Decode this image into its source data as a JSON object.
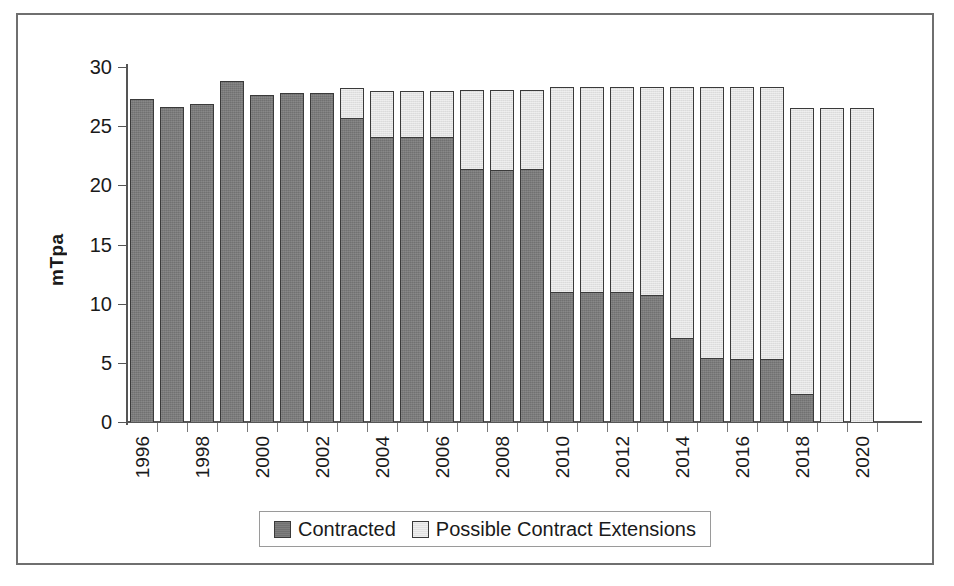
{
  "chart_data": {
    "type": "bar",
    "subtype": "stacked-vertical",
    "title": "",
    "xlabel": "",
    "ylabel": "mTpa",
    "ylim": [
      0,
      30
    ],
    "yticks": [
      0,
      5,
      10,
      15,
      20,
      25,
      30
    ],
    "ytick_labels": [
      "0",
      "5",
      "10",
      "15",
      "20",
      "25",
      "30"
    ],
    "grid": false,
    "legend_position": "bottom-center",
    "categories": [
      "1996",
      "1997",
      "1998",
      "1999",
      "2000",
      "2001",
      "2002",
      "2003",
      "2004",
      "2005",
      "2006",
      "2007",
      "2008",
      "2009",
      "2010",
      "2011",
      "2012",
      "2013",
      "2014",
      "2015",
      "2016",
      "2017",
      "2018",
      "2019",
      "2020"
    ],
    "xtick_labels_shown": [
      "1996",
      "1998",
      "2000",
      "2002",
      "2004",
      "2006",
      "2008",
      "2010",
      "2012",
      "2014",
      "2016",
      "2018",
      "2020"
    ],
    "series": [
      {
        "name": "Contracted",
        "color": "#717171",
        "values": [
          27.3,
          26.6,
          26.9,
          28.8,
          27.6,
          27.8,
          27.8,
          25.7,
          24.1,
          24.1,
          24.1,
          21.4,
          21.3,
          21.4,
          11.0,
          11.0,
          11.0,
          10.7,
          7.1,
          5.4,
          5.3,
          5.3,
          2.4,
          0.0,
          0.0
        ]
      },
      {
        "name": "Possible Contract Extensions",
        "color": "#e2e2e2",
        "values": [
          0.0,
          0.0,
          0.0,
          0.0,
          0.0,
          0.0,
          0.0,
          2.5,
          3.9,
          3.9,
          3.9,
          6.7,
          6.8,
          6.7,
          17.3,
          17.3,
          17.3,
          17.6,
          21.2,
          22.9,
          23.0,
          23.0,
          24.1,
          26.5,
          26.5
        ]
      }
    ],
    "totals": [
      27.3,
      26.6,
      26.9,
      28.8,
      27.6,
      27.8,
      27.8,
      28.2,
      28.0,
      28.0,
      28.0,
      28.1,
      28.1,
      28.1,
      28.3,
      28.3,
      28.3,
      28.3,
      28.3,
      28.3,
      28.3,
      28.3,
      26.5,
      26.5,
      26.5
    ]
  },
  "legend": {
    "items": [
      {
        "label": "Contracted",
        "swatch": "dark"
      },
      {
        "label": "Possible Contract Extensions",
        "swatch": "light"
      }
    ]
  }
}
